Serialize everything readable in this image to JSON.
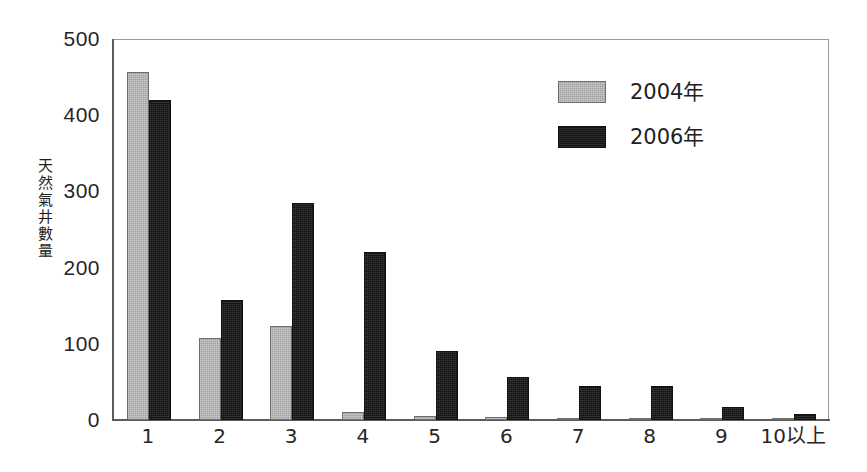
{
  "chart_data": {
    "type": "bar",
    "title": "",
    "subtitle": "",
    "xlabel": "",
    "ylabel": "天然氣井數量",
    "categories": [
      "1",
      "2",
      "3",
      "4",
      "5",
      "6",
      "7",
      "8",
      "9",
      "10以上"
    ],
    "series": [
      {
        "name": "2004年",
        "color": "#b4b4b4",
        "values": [
          457,
          108,
          124,
          10,
          5,
          4,
          2,
          1,
          1,
          1
        ]
      },
      {
        "name": "2006年",
        "color": "#1c1c1c",
        "values": [
          420,
          157,
          285,
          220,
          90,
          56,
          45,
          45,
          17,
          8
        ]
      }
    ],
    "ylim": [
      0,
      500
    ],
    "yticks": [
      0,
      100,
      200,
      300,
      400,
      500
    ],
    "ytick_labels": [
      "0",
      "100",
      "200",
      "300",
      "400",
      "500"
    ],
    "grid": false,
    "legend_position": "upper-right-inside",
    "legend_entries": [
      "2004年",
      "2006年"
    ]
  },
  "axes": {
    "y_title_chars": [
      "天",
      "然",
      "氣",
      "井",
      "數",
      "量"
    ]
  }
}
